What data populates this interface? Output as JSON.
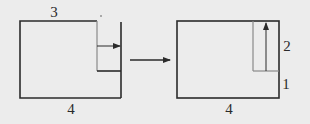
{
  "diagram": {
    "left_figure": {
      "top_label": "3",
      "bottom_label": "4",
      "dot": "·"
    },
    "right_figure": {
      "bottom_label": "4",
      "right_upper_label": "2",
      "right_lower_label": "1"
    },
    "colors": {
      "stroke": "#2b2b2b",
      "gray_stroke": "#8a8a8a",
      "background": "#ececec"
    }
  }
}
